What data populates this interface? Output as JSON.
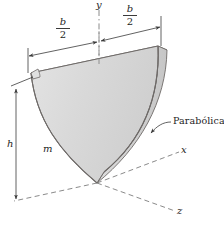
{
  "figure": {
    "kind": "engineering-diagram",
    "axes": {
      "y_label": "y",
      "x_label": "x",
      "z_label": "z"
    },
    "dimensions": {
      "half_width_left": {
        "numerator": "b",
        "denominator": "2"
      },
      "half_width_right": {
        "numerator": "b",
        "denominator": "2"
      },
      "height_label": "h"
    },
    "mass_label": "m",
    "annotation": {
      "text": "Parabólica",
      "points_to": "curved-parabolic-edge"
    },
    "colors": {
      "plate_face": "#d9d9d9",
      "plate_top": "#ececec",
      "plate_side": "#c9c9c9",
      "outline": "#6e6a68",
      "line": "#3a3a3a",
      "dashed_axis": "#7d7d7d",
      "text": "#1d1d1d",
      "background": "#ffffff"
    }
  }
}
